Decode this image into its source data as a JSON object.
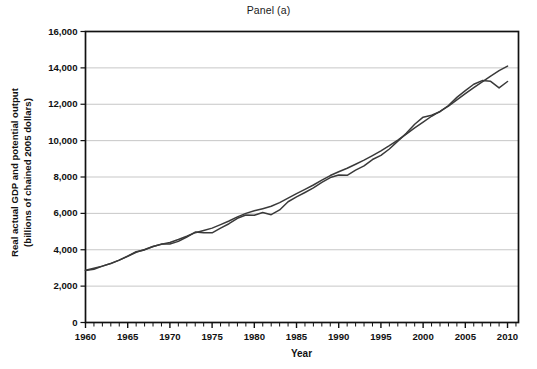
{
  "chart_data": {
    "type": "line",
    "title": "Panel (a)",
    "xlabel": "Year",
    "ylabel": "Real actual GDP and potential output (billions of chained 2005 dollars)",
    "ylabel_line1": "Real actual GDP and potential output",
    "ylabel_line2": "(billions of chained 2005 dollars)",
    "xlim": [
      1960,
      2011.3
    ],
    "ylim": [
      0,
      16000
    ],
    "ytick_values": [
      0,
      2000,
      4000,
      6000,
      8000,
      10000,
      12000,
      14000,
      16000
    ],
    "ytick_labels": [
      "0",
      "2,000",
      "4,000",
      "6,000",
      "8,000",
      "10,000",
      "12,000",
      "14,000",
      "16,000"
    ],
    "xtick_values": [
      1960,
      1965,
      1970,
      1975,
      1980,
      1985,
      1990,
      1995,
      2000,
      2005,
      2010
    ],
    "xtick_labels": [
      "1960",
      "1965",
      "1970",
      "1975",
      "1980",
      "1985",
      "1990",
      "1995",
      "2000",
      "2005",
      "2010"
    ],
    "x_minor_tick_interval": 1,
    "grid": "horizontal",
    "grid_color": "#b9b9b9",
    "axis_color": "#111111",
    "line_color": "#3a3a3a",
    "legend": "none",
    "x": [
      1960,
      1961,
      1962,
      1963,
      1964,
      1965,
      1966,
      1967,
      1968,
      1969,
      1970,
      1971,
      1972,
      1973,
      1974,
      1975,
      1976,
      1977,
      1978,
      1979,
      1980,
      1981,
      1982,
      1983,
      1984,
      1985,
      1986,
      1987,
      1988,
      1989,
      1990,
      1991,
      1992,
      1993,
      1994,
      1995,
      1996,
      1997,
      1998,
      1999,
      2000,
      2001,
      2002,
      2003,
      2004,
      2005,
      2006,
      2007,
      2008,
      2009,
      2010
    ],
    "series": [
      {
        "name": "Real actual GDP",
        "values": [
          2860,
          2930,
          3100,
          3240,
          3430,
          3650,
          3890,
          3990,
          4180,
          4310,
          4320,
          4460,
          4700,
          4970,
          4940,
          4930,
          5190,
          5430,
          5730,
          5910,
          5900,
          6050,
          5930,
          6190,
          6640,
          6910,
          7150,
          7400,
          7700,
          7970,
          8110,
          8090,
          8380,
          8610,
          8960,
          9190,
          9540,
          9970,
          10400,
          10900,
          11290,
          11400,
          11590,
          11930,
          12380,
          12750,
          13100,
          13300,
          13260,
          12900,
          13250
        ]
      },
      {
        "name": "Potential output",
        "values": [
          2870,
          2980,
          3100,
          3250,
          3430,
          3640,
          3860,
          4010,
          4180,
          4300,
          4400,
          4560,
          4740,
          4940,
          5060,
          5190,
          5380,
          5580,
          5810,
          6000,
          6140,
          6260,
          6390,
          6590,
          6840,
          7090,
          7320,
          7560,
          7830,
          8080,
          8290,
          8480,
          8700,
          8930,
          9180,
          9440,
          9720,
          10030,
          10360,
          10700,
          11020,
          11340,
          11610,
          11900,
          12240,
          12580,
          12910,
          13230,
          13550,
          13850,
          14100
        ]
      }
    ],
    "annotations": [
      {
        "label": "actual below potential (early-1980s recession)",
        "x_range": [
          1980,
          1984
        ]
      },
      {
        "label": "actual above potential (late-1990s boom)",
        "x_range": [
          1997,
          2001
        ]
      },
      {
        "label": "actual below potential (Great Recession)",
        "x_range": [
          2007,
          2010
        ]
      }
    ]
  }
}
